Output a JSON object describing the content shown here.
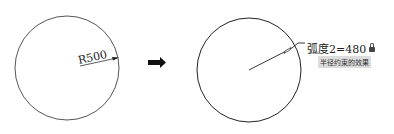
{
  "left_figure": {
    "dimension_label": "R500",
    "circle": {
      "cx": 67,
      "cy": 68,
      "r": 52
    }
  },
  "transition_arrow": {
    "icon": "right-arrow-icon"
  },
  "right_figure": {
    "parameter_label": "弧度2=480",
    "lock_icon": "lock-icon",
    "caption": "半径约束的效果",
    "circle": {
      "cx": 249,
      "cy": 70,
      "r": 52
    }
  },
  "colors": {
    "line": "#222222",
    "caption_bg": "#dcdcdc"
  }
}
